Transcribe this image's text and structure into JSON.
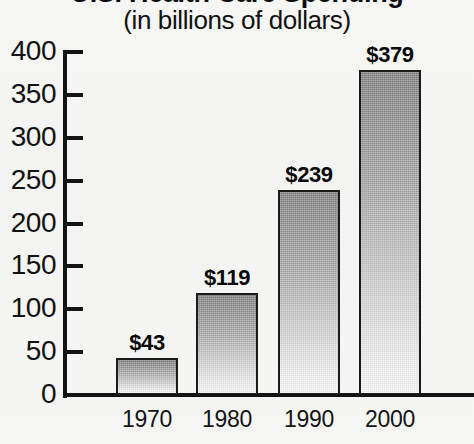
{
  "chart_data": {
    "type": "bar",
    "title": "U.S. Health Care Spending",
    "title_cropped": true,
    "subtitle": "(in billions of dollars)",
    "categories": [
      "1970",
      "1980",
      "1990",
      "2000"
    ],
    "values": [
      43,
      119,
      239,
      379
    ],
    "data_labels": [
      "$43",
      "$119",
      "$239",
      "$379"
    ],
    "xlabel": "",
    "ylabel": "",
    "ylim": [
      0,
      400
    ],
    "ytick_labels": [
      "400",
      "350",
      "300",
      "250",
      "200",
      "150",
      "100",
      "50",
      "0"
    ],
    "ytick_values": [
      400,
      350,
      300,
      250,
      200,
      150,
      100,
      50,
      0
    ],
    "grid": false,
    "legend": false,
    "series": [
      {
        "name": "Spending",
        "values": [
          43,
          119,
          239,
          379
        ]
      }
    ],
    "colors": {
      "background": "#f4f4f2",
      "axis": "#131313",
      "bar_top": "#848484",
      "bar_bottom": "#fafafa",
      "bar_outline": "#1a1a1a",
      "text": "#111111"
    }
  }
}
